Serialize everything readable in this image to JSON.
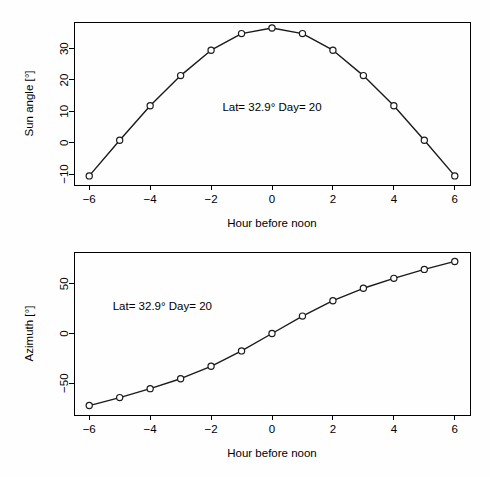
{
  "figure": {
    "background_color": "#ffffff",
    "ink_color": "#000000",
    "panel_count": 2
  },
  "chart_data": [
    {
      "type": "line",
      "title": "",
      "xlabel": "Hour before noon",
      "ylabel": "Sun angle [°]",
      "xlim": [
        -6.5,
        6.5
      ],
      "ylim": [
        -13.5,
        38.5
      ],
      "xticks": [
        -6,
        -4,
        -2,
        0,
        2,
        4,
        6
      ],
      "xticklabels": [
        "−6",
        "−4",
        "−2",
        "0",
        "2",
        "4",
        "6"
      ],
      "yticks": [
        -10,
        0,
        10,
        20,
        30
      ],
      "yticklabels": [
        "−10",
        "0",
        "10",
        "20",
        "30"
      ],
      "grid": false,
      "legend": "none",
      "marker": "open-circle",
      "annotation": "Lat= 32.9° Day= 20",
      "annotation_x": 0.0,
      "annotation_y": 10.0,
      "x": [
        -6,
        -5,
        -4,
        -3,
        -2,
        -1,
        0,
        1,
        2,
        3,
        4,
        5,
        6
      ],
      "y": [
        -10.6,
        0.8,
        11.8,
        21.4,
        29.5,
        34.8,
        36.6,
        34.8,
        29.5,
        21.4,
        11.8,
        0.8,
        -10.6
      ]
    },
    {
      "type": "line",
      "title": "",
      "xlabel": "Hour before noon",
      "ylabel": "Azimuth [°]",
      "xlim": [
        -6.5,
        6.5
      ],
      "ylim": [
        -82,
        82
      ],
      "xticks": [
        -6,
        -4,
        -2,
        0,
        2,
        4,
        6
      ],
      "xticklabels": [
        "−6",
        "−4",
        "−2",
        "0",
        "2",
        "4",
        "6"
      ],
      "yticks": [
        -50,
        0,
        50
      ],
      "yticklabels": [
        "−50",
        "0",
        "50"
      ],
      "grid": false,
      "legend": "none",
      "marker": "open-circle",
      "annotation": "Lat= 32.9° Day= 20",
      "annotation_x": -3.6,
      "annotation_y": 24.0,
      "x": [
        -6,
        -5,
        -4,
        -3,
        -2,
        -1,
        0,
        1,
        2,
        3,
        4,
        5,
        6
      ],
      "y": [
        -72.5,
        -64.5,
        -55.5,
        -45.5,
        -33.0,
        -17.5,
        0.0,
        17.5,
        33.0,
        45.5,
        55.5,
        64.5,
        72.5
      ]
    }
  ]
}
